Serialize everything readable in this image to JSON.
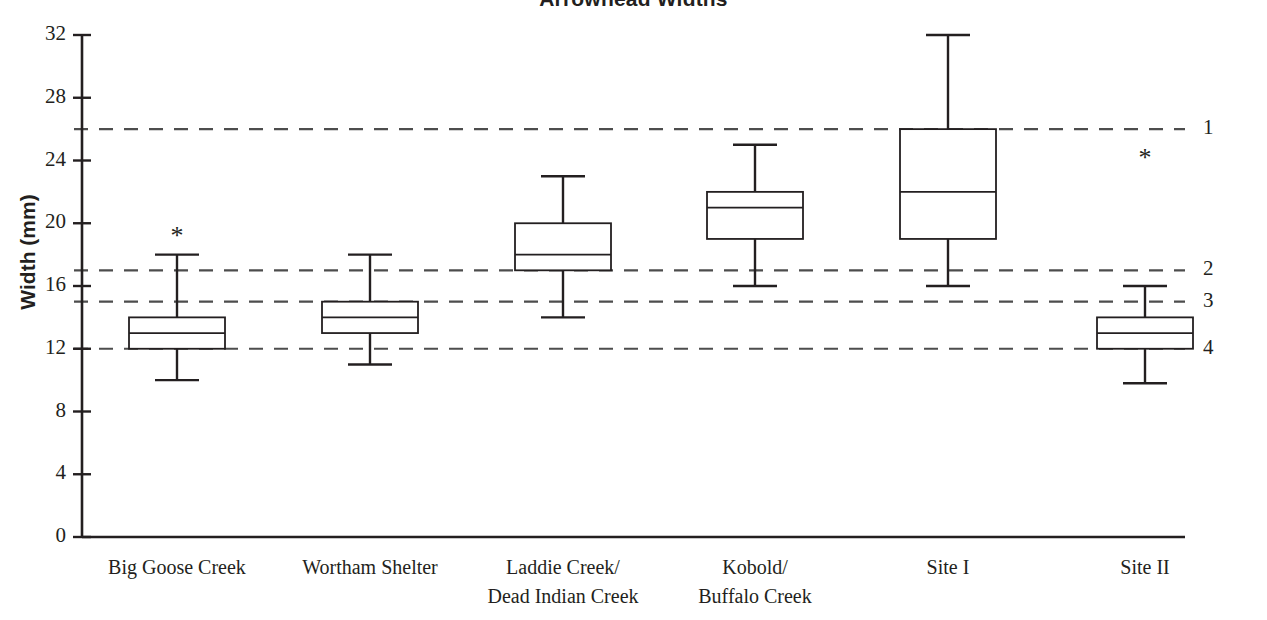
{
  "chart": {
    "title": "Arrowhead Widths",
    "ylabel": "Width (mm)",
    "xlabel": ""
  },
  "chart_data": {
    "type": "box",
    "title": "Arrowhead Widths",
    "xlabel": "",
    "ylabel": "Width (mm)",
    "ylim": [
      0,
      32
    ],
    "yticks": [
      0,
      4,
      8,
      12,
      16,
      20,
      24,
      28,
      32
    ],
    "ytick_labels": [
      "0",
      "4",
      "8",
      "12",
      "16",
      "20",
      "24",
      "28",
      "32"
    ],
    "grid": false,
    "legend": "none",
    "categories": [
      "Big Goose Creek",
      "Wortham Shelter",
      "Laddie Creek/ Dead Indian Creek",
      "Kobold/ Buffalo Creek",
      "Site I",
      "Site II"
    ],
    "category_label_lines": [
      [
        "Big Goose Creek"
      ],
      [
        "Wortham Shelter"
      ],
      [
        "Laddie Creek/",
        "Dead Indian Creek"
      ],
      [
        "Kobold/",
        "Buffalo Creek"
      ],
      [
        "Site I"
      ],
      [
        "Site II"
      ]
    ],
    "boxes": [
      {
        "name": "Big Goose Creek",
        "whisker_low": 10.0,
        "q1": 12.0,
        "median": 13.0,
        "q3": 14.0,
        "whisker_high": 18.0,
        "marker": "*"
      },
      {
        "name": "Wortham Shelter",
        "whisker_low": 11.0,
        "q1": 13.0,
        "median": 14.0,
        "q3": 15.0,
        "whisker_high": 18.0,
        "marker": ""
      },
      {
        "name": "Laddie Creek/ Dead Indian Creek",
        "whisker_low": 14.0,
        "q1": 17.0,
        "median": 18.0,
        "q3": 20.0,
        "whisker_high": 23.0,
        "marker": ""
      },
      {
        "name": "Kobold/ Buffalo Creek",
        "whisker_low": 16.0,
        "q1": 19.0,
        "median": 21.0,
        "q3": 22.0,
        "whisker_high": 25.0,
        "marker": ""
      },
      {
        "name": "Site I",
        "whisker_low": 16.0,
        "q1": 19.0,
        "median": 22.0,
        "q3": 26.0,
        "whisker_high": 32.0,
        "marker": ""
      },
      {
        "name": "Site II",
        "whisker_low": 9.8,
        "q1": 12.0,
        "median": 13.0,
        "q3": 14.0,
        "whisker_high": 16.0,
        "marker": "*"
      }
    ],
    "reference_lines": [
      {
        "label": "1",
        "value": 26.0
      },
      {
        "label": "2",
        "value": 17.0
      },
      {
        "label": "3",
        "value": 15.0
      },
      {
        "label": "4",
        "value": 12.0
      }
    ],
    "markers": [
      {
        "symbol": "*",
        "category": "Big Goose Creek",
        "value": 19.0
      },
      {
        "symbol": "*",
        "category": "Site II",
        "value": 24.0
      }
    ],
    "colors": {
      "axis": "#231f20",
      "box_stroke": "#231f20",
      "box_fill": "#ffffff",
      "reference_line": "#4d4d4d",
      "text": "#231f20",
      "background": "#ffffff"
    }
  }
}
